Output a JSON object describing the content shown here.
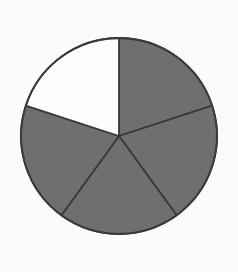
{
  "figure": {
    "name": "fraction-circle",
    "background_color": "#fbfbfb"
  },
  "chart_data": {
    "type": "pie",
    "title": "",
    "subtitle": "",
    "xlabel": "",
    "ylabel": "",
    "legend": [],
    "grid": false,
    "total_parts": 5,
    "shaded_parts": 4,
    "unshaded_parts": 1,
    "fraction_shaded": "4/5",
    "slice_angle_degrees": 72,
    "start_angle_degrees": -90,
    "categories": [
      "part-1",
      "part-2",
      "part-3",
      "part-4",
      "part-5"
    ],
    "values": [
      20,
      20,
      20,
      20,
      20
    ],
    "slices": [
      {
        "index": 0,
        "label": "part-1",
        "value": 20,
        "start_angle": -90,
        "end_angle": -18,
        "state": "shaded",
        "fill": "#6f6f6f"
      },
      {
        "index": 1,
        "label": "part-2",
        "value": 20,
        "start_angle": -18,
        "end_angle": 54,
        "state": "shaded",
        "fill": "#6f6f6f"
      },
      {
        "index": 2,
        "label": "part-3",
        "value": 20,
        "start_angle": 54,
        "end_angle": 126,
        "state": "shaded",
        "fill": "#6f6f6f"
      },
      {
        "index": 3,
        "label": "part-4",
        "value": 20,
        "start_angle": 126,
        "end_angle": 198,
        "state": "shaded",
        "fill": "#6f6f6f"
      },
      {
        "index": 4,
        "label": "part-5",
        "value": 20,
        "start_angle": 198,
        "end_angle": 270,
        "state": "unshaded",
        "fill": "#fdfdfd"
      }
    ],
    "geometry": {
      "center_x": 119,
      "center_y": 136,
      "radius": 98
    },
    "colors": {
      "shaded": "#6f6f6f",
      "unshaded": "#fdfdfd",
      "stroke": "#3a3a3a",
      "background": "#fbfbfb"
    },
    "stroke_width": 1.8
  }
}
